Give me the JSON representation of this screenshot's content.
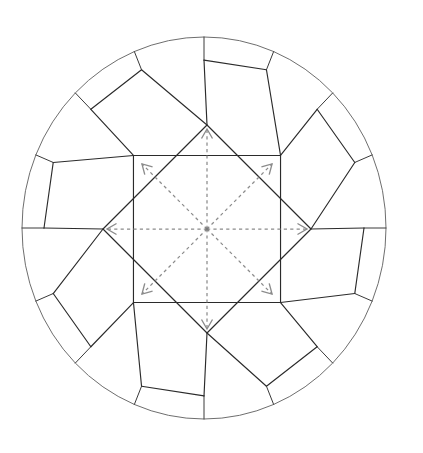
{
  "diagram": {
    "title": "Round brilliant cut diamond facet diagram with radiating direction arrows",
    "background_color": "#ffffff",
    "canvas": {
      "width": 423,
      "height": 453
    },
    "girdle": {
      "name": "girdle-outline",
      "shape": "ellipse",
      "center": {
        "x": 204,
        "y": 228
      },
      "radius_x": 182,
      "radius_y": 191,
      "stroke_color": "#6e6e6e",
      "stroke_width": 1
    },
    "facets": {
      "stroke_color": "#2b2b2b",
      "stroke_width": 1.15,
      "star_center": {
        "x": 207,
        "y": 229
      },
      "star_point_radius": 104,
      "star_inner_radius": 70,
      "star_points": 8,
      "outer_quad_radius": 160,
      "description": "Two overlapping rotated squares form an eight-pointed star table outline; eight bezel quadrilaterals ring the star and meet the girdle circle."
    },
    "arrows": {
      "name": "radiating-direction-arrows",
      "count": 8,
      "stroke_color": "#8b8b8b",
      "stroke_width": 1.25,
      "dash_pattern": "3.2 3.2",
      "origin": {
        "x": 207,
        "y": 229
      },
      "directions": [
        {
          "label": "up",
          "angle_deg": 270,
          "length": 100
        },
        {
          "label": "up-right",
          "angle_deg": 315,
          "length": 92
        },
        {
          "label": "right",
          "angle_deg": 0,
          "length": 100
        },
        {
          "label": "down-right",
          "angle_deg": 45,
          "length": 92
        },
        {
          "label": "down",
          "angle_deg": 90,
          "length": 100
        },
        {
          "label": "down-left",
          "angle_deg": 135,
          "length": 92
        },
        {
          "label": "left",
          "angle_deg": 180,
          "length": 100
        },
        {
          "label": "up-left",
          "angle_deg": 225,
          "length": 92
        }
      ],
      "arrowhead_length": 11,
      "arrowhead_spread_deg": 30
    },
    "center_marker": {
      "name": "culet-center-dot",
      "color": "#7a7a7a",
      "radius": 1.8
    }
  }
}
